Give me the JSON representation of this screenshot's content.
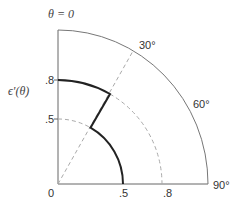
{
  "diagram": {
    "title": "θ = 0",
    "ylabel": "ϵ'(θ)",
    "radial_ticks": {
      "vertical": [
        ".8",
        ".5"
      ],
      "horizontal": [
        ".5",
        ".8"
      ],
      "origin": "0"
    },
    "angle_labels": [
      "30°",
      "60°",
      "90°"
    ],
    "colors": {
      "axes": "#666666",
      "outer_arc": "#777777",
      "curve": "#222222",
      "dashed": "#aaaaaa"
    },
    "curve": {
      "description": "Piecewise polar profile: r=0.8 for 0°–30°, radial drop at 30°, r=0.5 for 30°–90°",
      "segments": [
        {
          "from_deg": 0,
          "to_deg": 30,
          "r": 0.8
        },
        {
          "at_deg": 30,
          "r_from": 0.8,
          "r_to": 0.5
        },
        {
          "from_deg": 30,
          "to_deg": 90,
          "r": 0.5
        }
      ]
    },
    "dashed": [
      {
        "type": "arc",
        "r": 0.5,
        "from_deg": 0,
        "to_deg": 30
      },
      {
        "type": "arc",
        "r": 0.8,
        "from_deg": 30,
        "to_deg": 90
      },
      {
        "type": "radial",
        "deg": 30
      }
    ]
  }
}
